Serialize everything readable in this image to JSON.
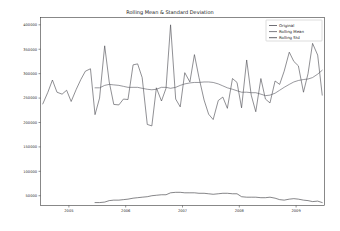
{
  "chart_data": {
    "type": "line",
    "title": "Rolling Mean & Standard Deviation",
    "xlabel": "",
    "ylabel": "",
    "grid": false,
    "legend_position": "upper right",
    "xlim": [
      2004.5,
      2009.5
    ],
    "ylim": [
      30000,
      415000
    ],
    "xticks": [
      2005,
      2006,
      2007,
      2008,
      2009
    ],
    "xticklabels": [
      "2005",
      "2006",
      "2007",
      "2008",
      "2009"
    ],
    "yticks": [
      50000,
      100000,
      150000,
      200000,
      250000,
      300000,
      350000,
      400000
    ],
    "yticklabels": [
      "50000",
      "100000",
      "150000",
      "200000",
      "250000",
      "300000",
      "350000",
      "400000"
    ],
    "series": [
      {
        "name": "Original",
        "color": "#4a4a52",
        "x": [
          2004.54,
          2004.63,
          2004.71,
          2004.79,
          2004.88,
          2004.96,
          2005.04,
          2005.13,
          2005.21,
          2005.29,
          2005.38,
          2005.46,
          2005.54,
          2005.63,
          2005.71,
          2005.79,
          2005.88,
          2005.96,
          2006.04,
          2006.13,
          2006.21,
          2006.29,
          2006.38,
          2006.46,
          2006.54,
          2006.63,
          2006.71,
          2006.79,
          2006.88,
          2006.96,
          2007.04,
          2007.13,
          2007.21,
          2007.29,
          2007.38,
          2007.46,
          2007.54,
          2007.63,
          2007.71,
          2007.79,
          2007.88,
          2007.96,
          2008.04,
          2008.13,
          2008.21,
          2008.29,
          2008.38,
          2008.46,
          2008.54,
          2008.63,
          2008.71,
          2008.79,
          2008.88,
          2008.96,
          2009.04,
          2009.13,
          2009.21,
          2009.29,
          2009.38,
          2009.46
        ],
        "values": [
          238000,
          262000,
          287000,
          262000,
          258000,
          266000,
          243000,
          268000,
          288000,
          305000,
          310000,
          216000,
          250000,
          357000,
          283000,
          237000,
          236000,
          248000,
          247000,
          318000,
          320000,
          292000,
          196000,
          193000,
          271000,
          244000,
          270000,
          400000,
          248000,
          232000,
          302000,
          283000,
          339000,
          292000,
          246000,
          217000,
          206000,
          245000,
          252000,
          229000,
          290000,
          282000,
          230000,
          328000,
          256000,
          222000,
          290000,
          248000,
          240000,
          285000,
          278000,
          305000,
          344000,
          325000,
          316000,
          262000,
          300000,
          362000,
          338000,
          256000
        ]
      },
      {
        "name": "Rolling Mean",
        "color": "#5a5a62",
        "x": [
          2005.46,
          2005.54,
          2005.63,
          2005.71,
          2005.79,
          2005.88,
          2005.96,
          2006.04,
          2006.13,
          2006.21,
          2006.29,
          2006.38,
          2006.46,
          2006.54,
          2006.63,
          2006.71,
          2006.79,
          2006.88,
          2006.96,
          2007.04,
          2007.13,
          2007.21,
          2007.29,
          2007.38,
          2007.46,
          2007.54,
          2007.63,
          2007.71,
          2007.79,
          2007.88,
          2007.96,
          2008.04,
          2008.13,
          2008.21,
          2008.29,
          2008.38,
          2008.46,
          2008.54,
          2008.63,
          2008.71,
          2008.79,
          2008.88,
          2008.96,
          2009.04,
          2009.13,
          2009.21,
          2009.29,
          2009.38,
          2009.46
        ],
        "values": [
          271000,
          271000,
          276000,
          278000,
          277000,
          276000,
          274000,
          272000,
          272000,
          272000,
          270000,
          268000,
          267000,
          268000,
          272000,
          272000,
          270000,
          272000,
          276000,
          279000,
          281000,
          282000,
          282000,
          283000,
          283000,
          282000,
          279000,
          275000,
          271000,
          268000,
          265000,
          262000,
          262000,
          261000,
          261000,
          258000,
          255000,
          256000,
          260000,
          266000,
          272000,
          278000,
          283000,
          286000,
          288000,
          289000,
          292000,
          299000,
          307000
        ]
      },
      {
        "name": "Rolling Std",
        "color": "#3a3a40",
        "x": [
          2005.46,
          2005.54,
          2005.63,
          2005.71,
          2005.79,
          2005.88,
          2005.96,
          2006.04,
          2006.13,
          2006.21,
          2006.29,
          2006.38,
          2006.46,
          2006.54,
          2006.63,
          2006.71,
          2006.79,
          2006.88,
          2006.96,
          2007.04,
          2007.13,
          2007.21,
          2007.29,
          2007.38,
          2007.46,
          2007.54,
          2007.63,
          2007.71,
          2007.79,
          2007.88,
          2007.96,
          2008.04,
          2008.13,
          2008.21,
          2008.29,
          2008.38,
          2008.46,
          2008.54,
          2008.63,
          2008.71,
          2008.79,
          2008.88,
          2008.96,
          2009.04,
          2009.13,
          2009.21,
          2009.29,
          2009.38,
          2009.46
        ],
        "values": [
          36000,
          36000,
          37000,
          40000,
          41000,
          41000,
          42000,
          43000,
          45000,
          46000,
          47000,
          48000,
          50000,
          51000,
          52000,
          52000,
          56000,
          57000,
          57000,
          56000,
          56000,
          56000,
          55000,
          55000,
          54000,
          53000,
          54000,
          55000,
          55000,
          54000,
          54000,
          48000,
          47000,
          47000,
          47000,
          46000,
          46000,
          47000,
          45000,
          42000,
          41000,
          43000,
          44000,
          43000,
          41000,
          40000,
          38000,
          39000,
          36000
        ]
      }
    ]
  },
  "legend": {
    "entries": [
      "Original",
      "Rolling Mean",
      "Rolling Std"
    ]
  }
}
